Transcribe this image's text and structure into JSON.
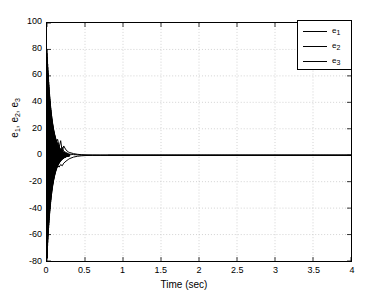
{
  "chart_data": {
    "type": "line",
    "title": "",
    "xlabel": "Time (sec)",
    "ylabel": "e_1, e_2, e_3",
    "ylabel_parts": [
      "e",
      "1",
      ", e",
      "2",
      ", e",
      "3"
    ],
    "xlim": [
      0,
      4
    ],
    "ylim": [
      -80,
      100
    ],
    "xticks": [
      0,
      0.5,
      1,
      1.5,
      2,
      2.5,
      3,
      3.5,
      4
    ],
    "xtick_labels": [
      "0",
      "0.5",
      "1",
      "1.5",
      "2",
      "2.5",
      "3",
      "3.5",
      "4"
    ],
    "yticks": [
      -80,
      -60,
      -40,
      -20,
      0,
      20,
      40,
      60,
      80,
      100
    ],
    "ytick_labels": [
      "-80",
      "-60",
      "-40",
      "-20",
      "0",
      "20",
      "40",
      "60",
      "80",
      "100"
    ],
    "grid": true,
    "grid_style": "dotted",
    "grid_color": "#c8c8c8",
    "line_color": "#000000",
    "background": "#ffffff",
    "legend_position": "top-right",
    "legend": [
      {
        "label": "e_1",
        "base": "e",
        "sub": "1",
        "color": "#000000",
        "style": "solid"
      },
      {
        "label": "e_2",
        "base": "e",
        "sub": "2",
        "color": "#000000",
        "style": "solid"
      },
      {
        "label": "e_3",
        "base": "e",
        "sub": "3",
        "color": "#000000",
        "style": "solid"
      }
    ],
    "series": [
      {
        "name": "e_1",
        "x": [
          0,
          0.005,
          0.01,
          0.015,
          0.02,
          0.03,
          0.04,
          0.05,
          0.06,
          0.07,
          0.08,
          0.09,
          0.1,
          0.12,
          0.14,
          0.16,
          0.18,
          0.2,
          0.22,
          0.25,
          0.28,
          0.3,
          0.35,
          0.4,
          0.45,
          0.5,
          0.6,
          0.7,
          0.8,
          1.0,
          1.5,
          2.0,
          2.5,
          3.0,
          3.5,
          4.0
        ],
        "y": [
          80,
          -78,
          62,
          -58,
          48,
          -40,
          33,
          -28,
          24,
          -20,
          17,
          -15,
          13,
          10,
          12,
          6,
          11,
          3,
          7,
          4,
          2.5,
          2,
          1.2,
          0.7,
          0.4,
          0.25,
          0.1,
          0.04,
          0.02,
          0,
          0,
          0,
          0,
          0,
          0,
          0
        ]
      },
      {
        "name": "e_2",
        "x": [
          0,
          0.005,
          0.01,
          0.015,
          0.02,
          0.03,
          0.04,
          0.05,
          0.06,
          0.07,
          0.08,
          0.09,
          0.1,
          0.12,
          0.14,
          0.16,
          0.18,
          0.2,
          0.22,
          0.25,
          0.28,
          0.3,
          0.35,
          0.4,
          0.45,
          0.5,
          0.6,
          0.7,
          0.8,
          1.0,
          1.5,
          2.0,
          2.5,
          3.0,
          3.5,
          4.0
        ],
        "y": [
          -70,
          66,
          -52,
          50,
          -42,
          35,
          -30,
          25,
          -21,
          18,
          -14,
          12,
          -10,
          -6,
          -8,
          -9,
          -7,
          -8,
          -6,
          -4.5,
          -3.2,
          -2.5,
          -1.4,
          -0.8,
          -0.45,
          -0.25,
          -0.1,
          -0.05,
          -0.02,
          0,
          0,
          0,
          0,
          0,
          0,
          0
        ]
      },
      {
        "name": "e_3",
        "x": [
          0,
          0.005,
          0.01,
          0.015,
          0.02,
          0.03,
          0.04,
          0.05,
          0.06,
          0.07,
          0.08,
          0.09,
          0.1,
          0.12,
          0.14,
          0.16,
          0.18,
          0.2,
          0.22,
          0.25,
          0.28,
          0.3,
          0.35,
          0.4,
          0.45,
          0.5,
          0.6,
          0.7,
          0.8,
          1.0,
          1.5,
          2.0,
          2.5,
          3.0,
          3.5,
          4.0
        ],
        "y": [
          55,
          -50,
          44,
          -38,
          30,
          -26,
          20,
          -17,
          14,
          -11,
          9,
          -7,
          6,
          3,
          -2,
          5,
          2,
          6,
          3,
          2,
          1.2,
          0.8,
          0.5,
          0.3,
          0.18,
          0.1,
          0.05,
          0.02,
          0.01,
          0,
          0,
          0,
          0,
          0,
          0,
          0
        ]
      }
    ],
    "chatter": {
      "t_end": 0.3,
      "amp_start_pos": 80,
      "amp_start_neg": -78,
      "decay_rate": 16,
      "frequency_steps": 260
    }
  }
}
